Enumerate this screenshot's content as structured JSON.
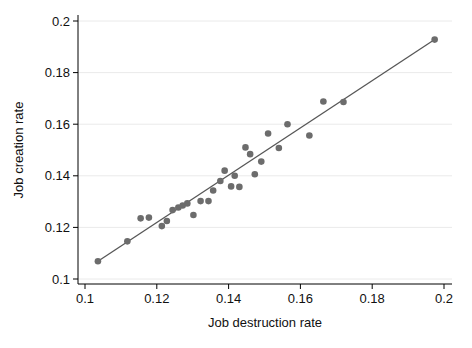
{
  "figure": {
    "background": "#ffffff"
  },
  "chart_data": {
    "type": "scatter",
    "title": "",
    "xlabel": "Job destruction rate",
    "ylabel": "Job creation rate",
    "xlim": [
      0.098,
      0.202
    ],
    "ylim": [
      0.098,
      0.202
    ],
    "x_ticks": [
      0.1,
      0.12,
      0.14,
      0.16,
      0.18,
      0.2
    ],
    "y_ticks": [
      0.1,
      0.12,
      0.14,
      0.16,
      0.18,
      0.2
    ],
    "grid": "horizontal-only",
    "legend_position": "none",
    "marker_color": "#6c6c6c",
    "fit_line_color": "#565656",
    "grid_color": "#eaeaea",
    "axis_color": "#000000",
    "points": [
      [
        0.1036,
        0.1069
      ],
      [
        0.1118,
        0.1146
      ],
      [
        0.1155,
        0.1235
      ],
      [
        0.1178,
        0.1238
      ],
      [
        0.1214,
        0.1205
      ],
      [
        0.1228,
        0.1225
      ],
      [
        0.1244,
        0.1267
      ],
      [
        0.126,
        0.1277
      ],
      [
        0.1272,
        0.1285
      ],
      [
        0.1285,
        0.1293
      ],
      [
        0.1302,
        0.1248
      ],
      [
        0.1322,
        0.1302
      ],
      [
        0.1344,
        0.1302
      ],
      [
        0.1357,
        0.1343
      ],
      [
        0.1377,
        0.138
      ],
      [
        0.1389,
        0.142
      ],
      [
        0.1407,
        0.1359
      ],
      [
        0.1417,
        0.14
      ],
      [
        0.143,
        0.1357
      ],
      [
        0.1447,
        0.151
      ],
      [
        0.146,
        0.1484
      ],
      [
        0.1473,
        0.1406
      ],
      [
        0.1491,
        0.1455
      ],
      [
        0.151,
        0.1564
      ],
      [
        0.154,
        0.1508
      ],
      [
        0.1564,
        0.16
      ],
      [
        0.1625,
        0.1556
      ],
      [
        0.1664,
        0.1688
      ],
      [
        0.172,
        0.1686
      ],
      [
        0.1974,
        0.1928
      ]
    ],
    "fit_line": {
      "x1": 0.1036,
      "y1": 0.1069,
      "x2": 0.1974,
      "y2": 0.1928
    }
  }
}
